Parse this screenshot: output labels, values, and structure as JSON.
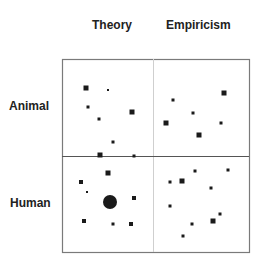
{
  "columns": [
    {
      "label": "Theory"
    },
    {
      "label": "Empiricism"
    }
  ],
  "rows": [
    {
      "label": "Animal"
    },
    {
      "label": "Human"
    }
  ],
  "grid": {
    "x": 62,
    "y": 59,
    "width": 187,
    "height": 193,
    "vdivider_x": 153,
    "hdivider_y": 156,
    "border_color": "#7a7a7a",
    "hdivider_color": "#555555",
    "vdivider_color": "#cfcfcf"
  },
  "marks": {
    "animal_theory": [
      {
        "shape": "square",
        "x": 86,
        "y": 88,
        "size": 5
      },
      {
        "shape": "square",
        "x": 108,
        "y": 90,
        "size": 2
      },
      {
        "shape": "square",
        "x": 88,
        "y": 107,
        "size": 3
      },
      {
        "shape": "square",
        "x": 99,
        "y": 119,
        "size": 3
      },
      {
        "shape": "square",
        "x": 132,
        "y": 112,
        "size": 5
      },
      {
        "shape": "square",
        "x": 113,
        "y": 142,
        "size": 3
      },
      {
        "shape": "square",
        "x": 100,
        "y": 155,
        "size": 5
      },
      {
        "shape": "square",
        "x": 134,
        "y": 156,
        "size": 3
      }
    ],
    "animal_empiricism": [
      {
        "shape": "square",
        "x": 224,
        "y": 93,
        "size": 5
      },
      {
        "shape": "square",
        "x": 173,
        "y": 100,
        "size": 3
      },
      {
        "shape": "square",
        "x": 193,
        "y": 113,
        "size": 3
      },
      {
        "shape": "square",
        "x": 166,
        "y": 123,
        "size": 5
      },
      {
        "shape": "square",
        "x": 221,
        "y": 123,
        "size": 3
      },
      {
        "shape": "square",
        "x": 199,
        "y": 135,
        "size": 5
      }
    ],
    "human_theory": [
      {
        "shape": "square",
        "x": 108,
        "y": 173,
        "size": 5
      },
      {
        "shape": "square",
        "x": 81,
        "y": 182,
        "size": 4
      },
      {
        "shape": "square",
        "x": 87,
        "y": 192,
        "size": 2
      },
      {
        "shape": "circle",
        "x": 110,
        "y": 202,
        "size": 14
      },
      {
        "shape": "square",
        "x": 134,
        "y": 198,
        "size": 4
      },
      {
        "shape": "square",
        "x": 84,
        "y": 221,
        "size": 4
      },
      {
        "shape": "square",
        "x": 113,
        "y": 224,
        "size": 3
      },
      {
        "shape": "square",
        "x": 131,
        "y": 224,
        "size": 4
      }
    ],
    "human_empiricism": [
      {
        "shape": "square",
        "x": 195,
        "y": 171,
        "size": 3
      },
      {
        "shape": "square",
        "x": 228,
        "y": 170,
        "size": 3
      },
      {
        "shape": "square",
        "x": 170,
        "y": 182,
        "size": 3
      },
      {
        "shape": "square",
        "x": 182,
        "y": 181,
        "size": 5
      },
      {
        "shape": "square",
        "x": 211,
        "y": 188,
        "size": 3
      },
      {
        "shape": "square",
        "x": 170,
        "y": 206,
        "size": 3
      },
      {
        "shape": "square",
        "x": 220,
        "y": 214,
        "size": 3
      },
      {
        "shape": "square",
        "x": 192,
        "y": 224,
        "size": 3
      },
      {
        "shape": "square",
        "x": 213,
        "y": 221,
        "size": 5
      },
      {
        "shape": "square",
        "x": 183,
        "y": 236,
        "size": 3
      }
    ]
  },
  "mark_color": "#1a1a1a"
}
